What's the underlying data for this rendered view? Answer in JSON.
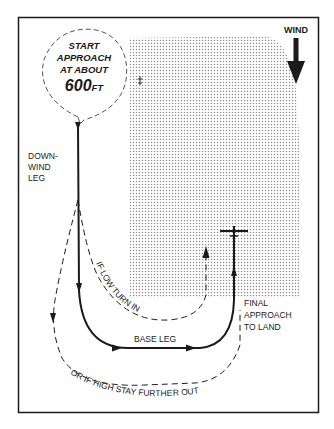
{
  "diagram": {
    "start_bubble": {
      "line1": "START",
      "line2": "APPROACH",
      "line3": "AT ABOUT",
      "altitude_value": "600",
      "altitude_unit": "FT"
    },
    "wind": {
      "label": "WIND",
      "direction": "down"
    },
    "legs": {
      "downwind_line1": "DOWN-",
      "downwind_line2": "WIND",
      "downwind_line3": "LEG",
      "base": "BASE LEG",
      "final_line1": "FINAL",
      "final_line2": "APPROACH",
      "final_line3": "TO LAND"
    },
    "alternatives": {
      "if_low": "IF LOW TURN IN",
      "if_high": "OR IF HIGH STAY FURTHER OUT"
    },
    "colors": {
      "ink": "#1a1a1a",
      "shade_dot": "#9a9a9a",
      "background": "#ffffff"
    }
  }
}
